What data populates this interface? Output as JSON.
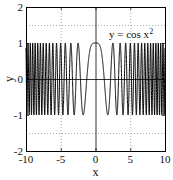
{
  "chart_data": {
    "type": "line",
    "title": "",
    "function": "y = cos(x^2)",
    "annotation": "y = cos x",
    "annotation_superscript": "2",
    "xlabel": "x",
    "ylabel": "y",
    "xlim": [
      -10,
      10
    ],
    "ylim": [
      -2,
      2
    ],
    "xticks": [
      -10,
      -5,
      0,
      5,
      10
    ],
    "xtick_labels": [
      "-10",
      "-5",
      "0",
      "5",
      "10"
    ],
    "yticks": [
      -2,
      -1,
      0,
      1,
      2
    ],
    "ytick_labels": [
      "-2",
      "-1",
      "0",
      "1",
      "2"
    ],
    "grid": {
      "on": true,
      "style": "dotted",
      "x_lines": [
        -5,
        5
      ],
      "y_lines": [
        -1.5,
        1.5
      ]
    },
    "zero_axes": true,
    "series": [
      {
        "name": "y = cos x^2",
        "color": "#000000",
        "x_range": [
          -10,
          10
        ],
        "samples": 4000,
        "key_points": [
          {
            "x": 0,
            "y": 1
          },
          {
            "x": 1.2533,
            "y": 0
          },
          {
            "x": 1.7725,
            "y": -1
          },
          {
            "x": 2.5066,
            "y": 1
          },
          {
            "x": -1.7725,
            "y": -1
          },
          {
            "x": -2.5066,
            "y": 1
          }
        ]
      }
    ],
    "legend": {
      "position": "none"
    }
  },
  "layout": {
    "plot_left": 26,
    "plot_right": 165,
    "plot_top": 7,
    "plot_bottom": 151
  }
}
